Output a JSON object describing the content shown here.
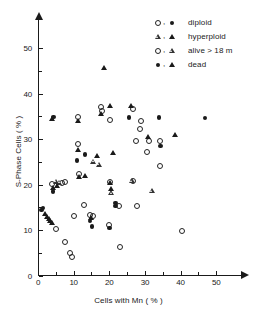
{
  "chart_data": {
    "type": "scatter",
    "title": "",
    "xlabel": "Cells with Mn  ( % )",
    "ylabel": "S-Phase Cells  ( % )",
    "xlim": [
      0,
      55
    ],
    "ylim": [
      0,
      55
    ],
    "xticks": [
      0,
      10,
      20,
      30,
      40,
      50
    ],
    "xtick_labels": [
      "0",
      "10",
      "20",
      "30",
      "40",
      "50"
    ],
    "xminor_ticks": [
      5,
      15,
      25,
      35,
      45
    ],
    "yticks": [
      0,
      10,
      20,
      30,
      40,
      50
    ],
    "ytick_labels": [
      "0",
      "10",
      "20",
      "30",
      "40",
      "50"
    ],
    "yminor_ticks": [
      5,
      15,
      25,
      35,
      45
    ],
    "grid": false,
    "legend_position": "top-right",
    "legend": [
      {
        "symbols": [
          "open-circle",
          "filled-circle"
        ],
        "label": "diploid"
      },
      {
        "symbols": [
          "open-triangle",
          "filled-triangle"
        ],
        "label": "hyperploid"
      },
      {
        "symbols": [
          "open-circle",
          "open-triangle"
        ],
        "label": "alive > 18 m"
      },
      {
        "symbols": [
          "filled-circle",
          "filled-triangle"
        ],
        "label": "dead"
      }
    ],
    "series": [
      {
        "name": "diploid alive > 18 m",
        "marker": "open-circle",
        "points": [
          [
            3.8,
            20.2
          ],
          [
            6.6,
            20.3
          ],
          [
            7.5,
            20.5
          ],
          [
            11.2,
            28.9
          ],
          [
            11.4,
            22.4
          ],
          [
            11.3,
            34.9
          ],
          [
            15.3,
            13.2
          ],
          [
            14.7,
            13.4
          ],
          [
            17.9,
            36.1
          ],
          [
            17.6,
            37.0
          ],
          [
            20.3,
            34.2
          ],
          [
            20.2,
            20.6
          ],
          [
            20.0,
            11.2
          ],
          [
            22.8,
            15.4
          ],
          [
            26.7,
            36.7
          ],
          [
            26.6,
            20.7
          ],
          [
            27.6,
            29.5
          ],
          [
            28.6,
            32.3
          ],
          [
            29.0,
            33.9
          ],
          [
            30.5,
            27.2
          ],
          [
            31.1,
            29.6
          ],
          [
            34.1,
            29.5
          ],
          [
            34.3,
            24.1
          ],
          [
            27.9,
            15.2
          ],
          [
            13.0,
            15.6
          ],
          [
            10.1,
            13.1
          ],
          [
            5.1,
            10.2
          ],
          [
            7.6,
            7.3
          ],
          [
            8.9,
            5.0
          ],
          [
            9.6,
            4.0
          ],
          [
            23.0,
            6.2
          ],
          [
            40.3,
            9.9
          ]
        ]
      },
      {
        "name": "diploid dead",
        "marker": "filled-circle",
        "points": [
          [
            1.4,
            14.9
          ],
          [
            1.0,
            14.4
          ],
          [
            4.4,
            34.9
          ],
          [
            4.2,
            18.5
          ],
          [
            11.0,
            25.3
          ],
          [
            13.2,
            26.6
          ],
          [
            14.6,
            12.0
          ],
          [
            15.1,
            10.8
          ],
          [
            20.1,
            10.4
          ],
          [
            21.8,
            16.0
          ],
          [
            21.7,
            15.3
          ],
          [
            25.5,
            34.8
          ],
          [
            33.9,
            34.8
          ],
          [
            34.4,
            28.5
          ],
          [
            46.8,
            34.7
          ]
        ]
      },
      {
        "name": "hyperploid alive > 18 m",
        "marker": "open-triangle",
        "points": [
          [
            5.0,
            20.6
          ],
          [
            6.0,
            20.4
          ],
          [
            20.6,
            18.1
          ],
          [
            26.4,
            20.7
          ],
          [
            31.9,
            18.6
          ],
          [
            15.5,
            25.0
          ],
          [
            17.1,
            24.4
          ]
        ]
      },
      {
        "name": "hyperploid dead",
        "marker": "filled-triangle",
        "points": [
          [
            1.9,
            13.6
          ],
          [
            2.6,
            12.9
          ],
          [
            3.1,
            12.4
          ],
          [
            3.5,
            12.0
          ],
          [
            3.9,
            11.6
          ],
          [
            4.0,
            34.5
          ],
          [
            4.3,
            19.3
          ],
          [
            5.3,
            19.6
          ],
          [
            11.1,
            27.6
          ],
          [
            11.3,
            34.0
          ],
          [
            11.6,
            21.6
          ],
          [
            15.0,
            12.6
          ],
          [
            17.7,
            35.6
          ],
          [
            18.5,
            45.7
          ],
          [
            16.5,
            26.2
          ],
          [
            20.2,
            37.4
          ],
          [
            20.4,
            19.0
          ],
          [
            20.1,
            20.4
          ],
          [
            21.0,
            27.0
          ],
          [
            26.0,
            37.4
          ],
          [
            30.8,
            30.4
          ],
          [
            38.4,
            31.0
          ],
          [
            13.1,
            22.0
          ]
        ]
      }
    ]
  }
}
